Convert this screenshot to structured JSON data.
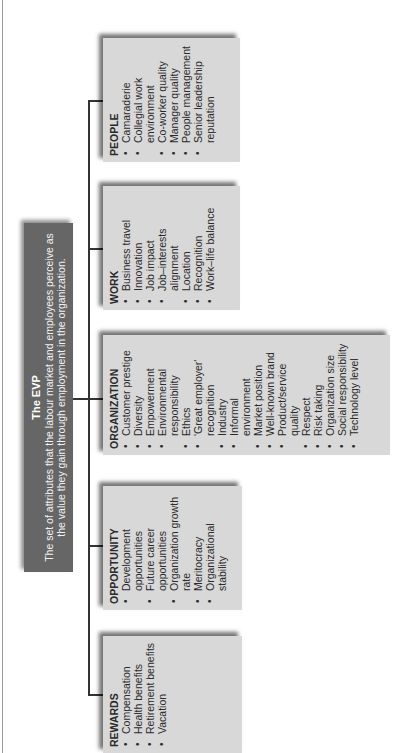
{
  "evp": {
    "title": "The EVP",
    "description": "The set of attributes that the labour market and employees perceive as the value they gain through employment in the organization."
  },
  "categories": [
    {
      "title": "REWARDS",
      "items": [
        "Compensation",
        "Health benefits",
        "Retirement benefits",
        "Vacation"
      ]
    },
    {
      "title": "OPPORTUNITY",
      "items": [
        "Development opportunities",
        "Future career opportunities",
        "Organization growth rate",
        "Meritocracy",
        "Organizational stability"
      ]
    },
    {
      "title": "ORGANIZATION",
      "items": [
        "Customer prestige",
        "Diversity",
        "Empowerment",
        "Environmental responsibility",
        "Ethics",
        "'Great employer' recognition",
        "Industry",
        "Informal environment",
        "Market position",
        "Well-known brand",
        "Product/service quality",
        "Respect",
        "Risk taking",
        "Organization size",
        "Social responsibility",
        "Technology level"
      ]
    },
    {
      "title": "WORK",
      "items": [
        "Business travel",
        "Innovation",
        "Job impact",
        "Job–interests alignment",
        "Location",
        "Recognition",
        "Work–life balance"
      ]
    },
    {
      "title": "PEOPLE",
      "items": [
        "Camaraderie",
        "Collegial work environment",
        "Co-worker quality",
        "Manager quality",
        "People management",
        "Senior leadership reputation"
      ]
    }
  ],
  "colors": {
    "header_bg": "#666666",
    "box_bg": "#d8d8d8",
    "line": "#333333"
  }
}
